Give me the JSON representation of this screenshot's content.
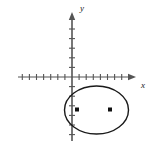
{
  "figure": {
    "kind": "coordinate-plane-with-ellipse",
    "width": 150,
    "height": 147,
    "background_color": "#ffffff",
    "stroke_color": "#1a1a1a",
    "axis_color": "#555555"
  },
  "axes": {
    "x_axis": {
      "label": "x",
      "label_x": 141,
      "label_y": 88,
      "start_x": 18,
      "end_x": 136,
      "y": 77,
      "arrow": "right",
      "tick_spacing": 7.1,
      "ticks_left_of_origin": 8,
      "ticks_right_of_origin": 8,
      "tick_half_length": 3
    },
    "y_axis": {
      "label": "y",
      "label_x": 80,
      "label_y": 11,
      "start_y": 12,
      "end_y": 141,
      "x": 72,
      "arrow": "up",
      "tick_spacing": 9.6,
      "ticks_above_origin": 6,
      "ticks_below_origin": 6,
      "tick_half_length": 3
    },
    "origin": {
      "x": 72,
      "y": 77
    }
  },
  "chart_data": {
    "type": "scatter",
    "title": "",
    "xlabel": "x",
    "ylabel": "y",
    "grid": false,
    "legend": "none",
    "xlim": [
      -8,
      9
    ],
    "ylim": [
      -7,
      7
    ],
    "shapes": [
      {
        "name": "ellipse",
        "type": "ellipse",
        "center_px": {
          "x": 96.5,
          "y": 110
        },
        "radius_x_px": 32,
        "radius_y_px": 24,
        "center_units": {
          "x": 3.5,
          "y": -3.4
        },
        "semi_major_units": 4.5,
        "semi_minor_units": 2.5,
        "stroke": "#1a1a1a",
        "stroke_width": 1.4,
        "fill": "none"
      }
    ],
    "points": [
      {
        "name": "focus-left",
        "px": {
          "x": 77,
          "y": 109.5
        },
        "units": {
          "x": 0.7,
          "y": -3.4
        },
        "marker": "filled-square-dot",
        "size_px": 4,
        "color": "#111111"
      },
      {
        "name": "focus-right",
        "px": {
          "x": 110,
          "y": 109.5
        },
        "units": {
          "x": 5.3,
          "y": -3.4
        },
        "marker": "filled-square-dot",
        "size_px": 4,
        "color": "#111111"
      }
    ]
  }
}
